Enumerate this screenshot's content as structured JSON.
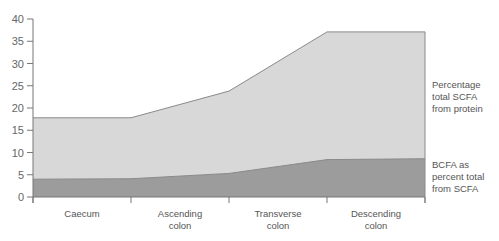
{
  "chart_data": {
    "type": "area",
    "title": "",
    "xlabel": "",
    "ylabel": "",
    "ylim": [
      0,
      40
    ],
    "yticks": [
      0,
      5,
      10,
      15,
      20,
      25,
      30,
      35,
      40
    ],
    "categories": [
      "Caecum",
      "Ascending colon",
      "Transverse colon",
      "Descending colon"
    ],
    "x_boundaries": [
      0,
      1,
      2,
      3,
      4
    ],
    "series": [
      {
        "name": "Percentage total SCFA from protein",
        "x": [
          0,
          1,
          2,
          3,
          4
        ],
        "values": [
          17.8,
          17.8,
          23.8,
          37.1,
          37.1
        ],
        "color": "#d8d8d8"
      },
      {
        "name": "BCFA as percent total from SCFA",
        "x": [
          0,
          1,
          2,
          3,
          4
        ],
        "values": [
          4.0,
          4.1,
          5.3,
          8.4,
          8.6
        ],
        "color": "#9c9c9c"
      }
    ],
    "grid": false,
    "legend_position": "right (inline labels)"
  },
  "xaxis": {
    "labels": [
      {
        "line1": "Caecum",
        "line2": ""
      },
      {
        "line1": "Ascending",
        "line2": "colon"
      },
      {
        "line1": "Transverse",
        "line2": "colon"
      },
      {
        "line1": "Descending",
        "line2": "colon"
      }
    ]
  },
  "legend": {
    "upper": {
      "line1": "Percentage",
      "line2": "total SCFA",
      "line3": "from protein"
    },
    "lower": {
      "line1": "BCFA as",
      "line2": "percent total",
      "line3": "from SCFA"
    }
  }
}
